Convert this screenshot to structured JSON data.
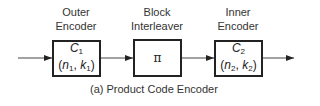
{
  "diagram": {
    "blocks": [
      {
        "id": "outer",
        "title_line1": "Outer",
        "title_line2": "Encoder",
        "symbol": "C",
        "symbol_sub": "1",
        "params_n": "n",
        "params_n_sub": "1",
        "params_k": "k",
        "params_k_sub": "1"
      },
      {
        "id": "interleaver",
        "title_line1": "Block",
        "title_line2": "Interleaver",
        "symbol": "π"
      },
      {
        "id": "inner",
        "title_line1": "Inner",
        "title_line2": "Encoder",
        "symbol": "C",
        "symbol_sub": "2",
        "params_n": "n",
        "params_n_sub": "2",
        "params_k": "k",
        "params_k_sub": "2"
      }
    ],
    "caption": "(a) Product Code Encoder",
    "colors": {
      "stroke": "#222222",
      "text": "#333333",
      "background": "#ffffff"
    }
  }
}
